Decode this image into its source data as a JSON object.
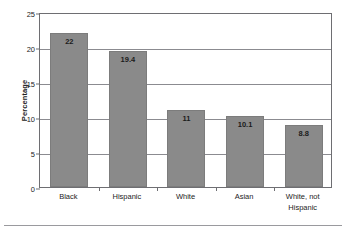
{
  "chart_data": {
    "type": "bar",
    "title": "",
    "subtitle": "",
    "xlabel": "",
    "ylabel": "Percentage",
    "categories": [
      "Black",
      "Hispanic",
      "White",
      "Asian",
      "White, not Hispanic"
    ],
    "category_lines": [
      [
        "Black"
      ],
      [
        "Hispanic"
      ],
      [
        "White"
      ],
      [
        "Asian"
      ],
      [
        "White, not",
        "Hispanic"
      ]
    ],
    "values": [
      22,
      19.4,
      11,
      10.1,
      8.8
    ],
    "value_labels": [
      "22",
      "19.4",
      "11",
      "10.1",
      "8.8"
    ],
    "ylim": [
      0,
      25
    ],
    "yticks": [
      0,
      5,
      10,
      15,
      20,
      25
    ],
    "ytick_labels": [
      "0",
      "5",
      "10",
      "15",
      "20",
      "25"
    ],
    "grid": "horizontal",
    "legend": "none",
    "bar_color": "#8a8a8a",
    "bar_border_color": "#7c7c7c",
    "axis_color": "#6e6e72",
    "grid_color": "#8b8b90",
    "text_color": "#1c1c1c"
  }
}
